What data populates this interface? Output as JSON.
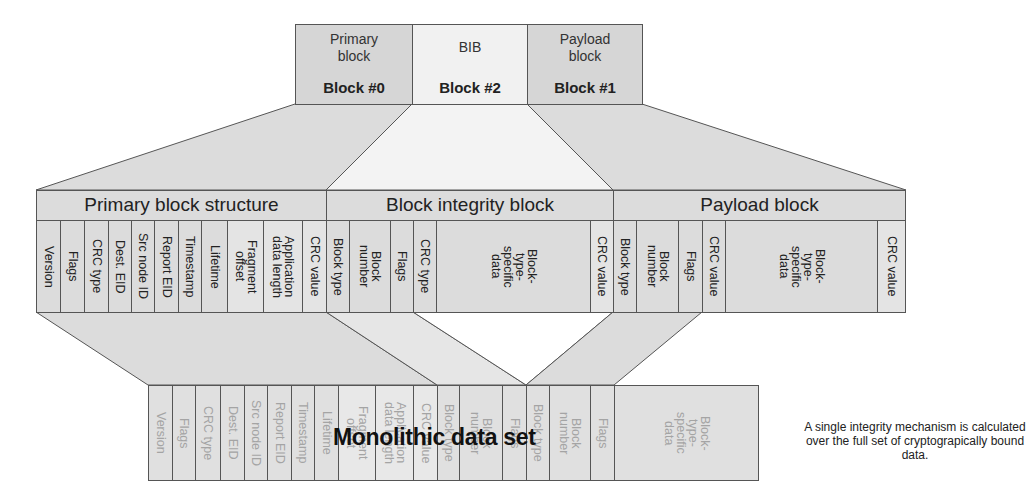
{
  "top_blocks": [
    {
      "name": "Primary block",
      "label": "Primary\nblock",
      "number": "Block #0",
      "fill": "#d6d6d6"
    },
    {
      "name": "BIB",
      "label": "BIB",
      "number": "Block #2",
      "fill": "#f1f1f1"
    },
    {
      "name": "Payload block",
      "label": "Payload\nblock",
      "number": "Block #1",
      "fill": "#d6d6d6"
    }
  ],
  "structure": {
    "primary": {
      "title": "Primary block structure",
      "fields": [
        "Version",
        "Flags",
        "CRC type",
        "Dest. EID",
        "Src node ID",
        "Report EID",
        "Timestamp",
        "Lifetime",
        "Fragment\noffset",
        "Application\ndata length",
        "CRC value"
      ]
    },
    "bib": {
      "title": "Block integrity block",
      "fields": [
        "Block type",
        "Block\nnumber",
        "Flags",
        "CRC type",
        "Block-\ntype-\nspecific\ndata",
        "CRC value"
      ]
    },
    "payload": {
      "title": "Payload block",
      "fields": [
        "Block type",
        "Block\nnumber",
        "Flags",
        "CRC value",
        "Block-\ntype-\nspecific\ndata",
        "CRC value"
      ]
    }
  },
  "monolithic": {
    "label": "Monolithic data set",
    "fields": [
      "Version",
      "Flags",
      "CRC type",
      "Dest. EID",
      "Src node ID",
      "Report EID",
      "Timestamp",
      "Lifetime",
      "Fragment\noffset",
      "Application\ndata length",
      "CRC value",
      "Block type",
      "Block\nnumber",
      "Flags",
      "Block type",
      "Block\nnumber",
      "Flags",
      "Block-\ntype-\nspecific\ndata"
    ]
  },
  "note": "A single integrity mechanism is calculated over the full set of cryptograpically bound data.",
  "colors": {
    "fill_dark": "#d6d6d6",
    "fill_light": "#f1f1f1",
    "stroke": "#555555",
    "ghost_text": "#a4a4a4"
  }
}
